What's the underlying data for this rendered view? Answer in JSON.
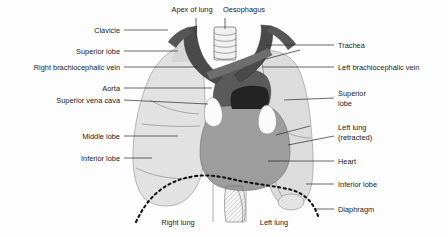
{
  "figure": {
    "background_color": "#fdfdfd",
    "text_color": "#1b1b1b",
    "leader_color": "#2a2a2a"
  },
  "palette": {
    "lung_light": "#e2e2e2",
    "lung_left": "#dcdcdc",
    "heart_gray": "#9d9d9d",
    "vessel_dark": "#4a4a4a",
    "vessel_mid": "#6e6e6e",
    "vessel_darkest": "#2b2b2b",
    "white_vessel": "#fbfbfb",
    "trachea_fill": "#f2f2f2",
    "outline": "#6f6f6f"
  },
  "labels": {
    "top": [
      {
        "id": "apex-of-lung",
        "text": "Apex of lung",
        "x": 192,
        "y": 12
      },
      {
        "id": "oesophagus",
        "text": "Oesophagus",
        "x": 244,
        "y": 12
      }
    ],
    "left": [
      {
        "id": "clavicle",
        "text": "Clavicle",
        "x": 120,
        "y": 33
      },
      {
        "id": "superior-lobe",
        "text": "Superior lobe",
        "x": 120,
        "y": 54
      },
      {
        "id": "right-brachiocephalic-vein",
        "text": "Right brachiocephalic vein",
        "x": 120,
        "y": 70
      },
      {
        "id": "aorta",
        "text": "Aorta",
        "x": 120,
        "y": 91
      },
      {
        "id": "superior-vena-cava",
        "text": "Superior vena cava",
        "x": 120,
        "y": 103
      },
      {
        "id": "middle-lobe",
        "text": "Middle lobe",
        "x": 120,
        "y": 139
      },
      {
        "id": "inferior-lobe-left",
        "text": "Inferior lobe",
        "x": 120,
        "y": 161
      }
    ],
    "right": [
      {
        "id": "trachea",
        "text": "Trachea",
        "x": 338,
        "y": 48
      },
      {
        "id": "left-brachiocephalic-vein",
        "text": "Left brachiocephalic vein",
        "x": 338,
        "y": 70
      },
      {
        "id": "superior-lobe-right",
        "text": "Superior",
        "text2": "lobe",
        "x": 338,
        "y": 96
      },
      {
        "id": "left-lung-retracted",
        "text": "Left lung",
        "text2": "(retracted)",
        "x": 338,
        "y": 130
      },
      {
        "id": "heart",
        "text": "Heart",
        "x": 338,
        "y": 164
      },
      {
        "id": "inferior-lobe-right",
        "text": "Inferior lobe",
        "x": 338,
        "y": 187
      },
      {
        "id": "diaphragm",
        "text": "Diaphragm",
        "x": 338,
        "y": 212
      }
    ],
    "bottom": [
      {
        "id": "right-lung",
        "text": "Right lung",
        "x": 178,
        "y": 225
      },
      {
        "id": "left-lung",
        "text": "Left lung",
        "x": 274,
        "y": 225
      }
    ]
  }
}
